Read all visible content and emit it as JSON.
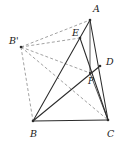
{
  "figure": {
    "type": "geometry-diagram",
    "background_color": "#ffffff",
    "solid_stroke_color": "#2b2b2b",
    "dashed_stroke_color": "#8a8a8a",
    "label_color": "#1a1a1a",
    "points": [
      {
        "id": "A",
        "label": "A",
        "x": 90,
        "y": 20,
        "label_x": 93,
        "label_y": 9,
        "size": "normal"
      },
      {
        "id": "Bp",
        "label": "B'",
        "x": 21,
        "y": 47,
        "label_x": 9,
        "label_y": 41,
        "size": "normal"
      },
      {
        "id": "E",
        "label": "E",
        "x": 80,
        "y": 38,
        "label_x": 72,
        "label_y": 33,
        "size": "normal"
      },
      {
        "id": "D",
        "label": "D",
        "x": 100,
        "y": 66,
        "label_x": 106,
        "label_y": 62,
        "size": "normal"
      },
      {
        "id": "P",
        "label": "P",
        "x": 90,
        "y": 73,
        "label_x": 88,
        "label_y": 81,
        "size": "small"
      },
      {
        "id": "B",
        "label": "B",
        "x": 33,
        "y": 121,
        "label_x": 30,
        "label_y": 134,
        "size": "normal"
      },
      {
        "id": "C",
        "label": "C",
        "x": 108,
        "y": 120,
        "label_x": 107,
        "label_y": 134,
        "size": "normal"
      }
    ],
    "segments": [
      {
        "id": "seg-A-B",
        "from": "A",
        "to": "B",
        "style": "solid"
      },
      {
        "id": "seg-B-C",
        "from": "B",
        "to": "C",
        "style": "solid"
      },
      {
        "id": "seg-A-C",
        "from": "A",
        "to": "C",
        "style": "solid"
      },
      {
        "id": "seg-A-P",
        "from": "A",
        "to": "P",
        "style": "solid"
      },
      {
        "id": "seg-P-C",
        "from": "P",
        "to": "C",
        "style": "solid"
      },
      {
        "id": "seg-E-C",
        "from": "E",
        "to": "C",
        "style": "solid"
      },
      {
        "id": "seg-B-D",
        "from": "B",
        "to": "D",
        "style": "solid"
      },
      {
        "id": "seg-Bp-A",
        "from": "Bp",
        "to": "A",
        "style": "dashed"
      },
      {
        "id": "seg-Bp-B",
        "from": "Bp",
        "to": "B",
        "style": "dashed"
      },
      {
        "id": "seg-Bp-E",
        "from": "Bp",
        "to": "E",
        "style": "dashed"
      },
      {
        "id": "seg-Bp-P",
        "from": "Bp",
        "to": "P",
        "style": "dashed"
      },
      {
        "id": "seg-Bp-C",
        "from": "Bp",
        "to": "C",
        "style": "dashed"
      }
    ]
  }
}
